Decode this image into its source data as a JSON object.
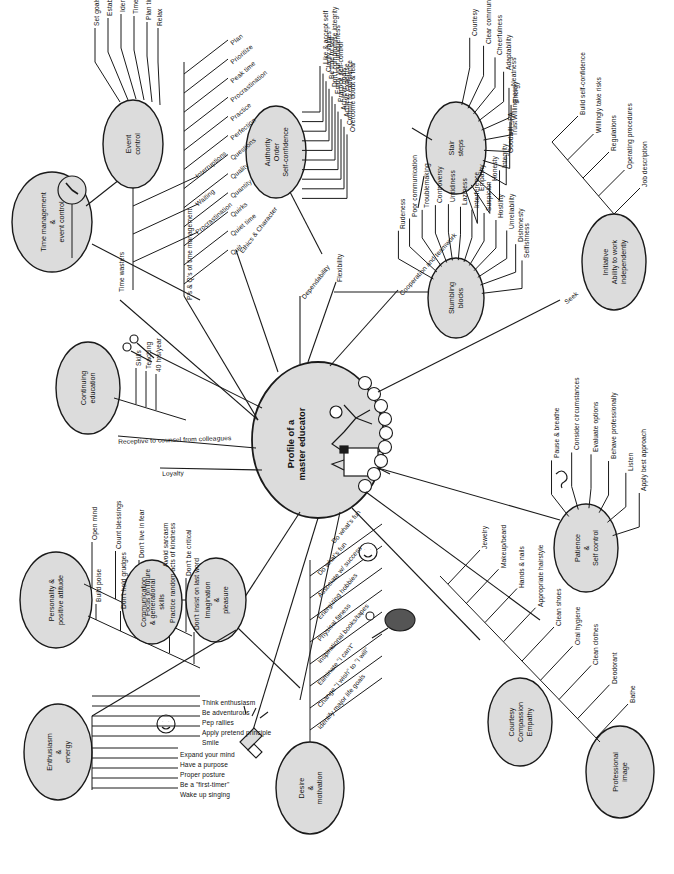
{
  "center": {
    "label_line1": "Profile of a",
    "label_line2": "master educator",
    "icon": "person-at-desk-icon"
  },
  "colors": {
    "node_fill": "#dcdcdc",
    "stroke": "#1a1a1a",
    "background": "#ffffff"
  },
  "spokes": [
    {
      "name": "ethics-character",
      "label": "Ethics & Character"
    },
    {
      "name": "dependability",
      "label": "Dependability"
    },
    {
      "name": "flexibility",
      "label": "Flexibility"
    },
    {
      "name": "cooperation-teamwork",
      "label": "Cooperation and teamwork"
    },
    {
      "name": "receptive-counsel",
      "label": "Receptive to counsel from colleagues"
    },
    {
      "name": "loyalty",
      "label": "Loyalty"
    },
    {
      "name": "seek",
      "label": "Seek"
    },
    {
      "name": "do-whats-fun",
      "label": "Do what's fun"
    }
  ],
  "branches": [
    {
      "name": "time-management",
      "label": "Time management\n&\nevent control",
      "label_lines": [
        "Time management",
        "&",
        "event control"
      ],
      "icon": "clock-icon",
      "children": []
    },
    {
      "name": "event-control",
      "label_lines": [
        "Event",
        "control"
      ],
      "children": [
        "Set goals",
        "Establish objectives",
        "Identify priorities",
        "Time log",
        "Plan time",
        "Relax"
      ]
    },
    {
      "name": "time-wasters",
      "label_lines": [
        "Time wasters"
      ],
      "children": [
        "Interruptions",
        "Waiting",
        "Procrastination"
      ]
    },
    {
      "name": "ps-and-qs",
      "label_lines": [
        "P's & Q's of time management"
      ],
      "children": [
        "Quit",
        "Quiet time",
        "Quirks",
        "Quantity",
        "Quality",
        "Questions",
        "Perfection",
        "Practice",
        "Procrastination",
        "Peak time",
        "Prioritize",
        "Plan"
      ]
    },
    {
      "name": "authority-order-self-confidence",
      "label_lines": [
        "Authority",
        "Order",
        "Self-confidence"
      ],
      "children": [
        "Like & accept self",
        "Clarify values",
        "Be true to self",
        "Don't compromise integrity",
        "Enjoy your uniqueness",
        "Practice self-control",
        "Achieve goals",
        "Achieve expertise",
        "Commit to excellence",
        "Overcome doubt & fear"
      ]
    },
    {
      "name": "stair-steps",
      "label_lines": [
        "Stair",
        "steps"
      ],
      "children": [
        "Courtesy",
        "Clear communications",
        "Cheerfulness",
        "Adaptability",
        "Neatness",
        "Energy",
        "Willingness",
        "Trust",
        "Goodwill - PA",
        "Integrity",
        "Honesty",
        "Empathy"
      ]
    },
    {
      "name": "stumbling-blocks",
      "label_lines": [
        "Stumbling",
        "blocks"
      ],
      "children": [
        "Rudeness",
        "Poor communication",
        "Troublemaking",
        "Controversy",
        "Untidiness",
        "Laziness",
        "Interference",
        "Suspicion",
        "Hostility",
        "Unreliability",
        "Dishonesty",
        "Selfishness"
      ]
    },
    {
      "name": "initiative",
      "label_lines": [
        "Initiative",
        "Ability to work",
        "independently"
      ],
      "children": [
        "Job description",
        "Operating procedures",
        "Regulations",
        "Willingly take risks",
        "Build self-confidence"
      ]
    },
    {
      "name": "continuing-education",
      "label_lines": [
        "Continuing",
        "education"
      ],
      "icon": "scissors-icon",
      "children": [
        "Skills",
        "Teaching",
        "40 hrs/year"
      ]
    },
    {
      "name": "personality-positive-attitude",
      "label_lines": [
        "Personality &",
        "positive attitude"
      ],
      "children": [
        "Open mind",
        "Count blessings",
        "Don't live in fear",
        "Avoid sarcasm",
        "Don't be critical",
        "Build poise",
        "Don't hold grudges",
        "Focus on future",
        "Practice random acts of kindness",
        "Don't insist on last word"
      ]
    },
    {
      "name": "communication-generational-skills",
      "label_lines": [
        "Communication",
        "& generational",
        "skills"
      ],
      "children": []
    },
    {
      "name": "imagination-pleasure",
      "label_lines": [
        "Imagination",
        "&",
        "pleasure"
      ],
      "children": []
    },
    {
      "name": "enthusiasm-energy",
      "label_lines": [
        "Enthusiasm",
        "&",
        "energy"
      ],
      "icons": [
        "smiley-icon",
        "megaphone-icon"
      ],
      "children": [
        "Wake up singing",
        "Be a \"first-timer\"",
        "Proper posture",
        "Have a purpose",
        "Expand your mind",
        "Smile",
        "Apply pretend principle",
        "Pep rallies",
        "Be adventurous",
        "Think enthusiasm"
      ]
    },
    {
      "name": "desire-motivation",
      "label_lines": [
        "Desire",
        "&",
        "motivation"
      ],
      "icons": [
        "smiley-icon",
        "tennis-racket-icon"
      ],
      "children": [
        "Do what's fun",
        "Associate w/ success",
        "Energizing hobbies",
        "Physical fitness",
        "Inspirational books/tapes",
        "Eliminate \"I can't\"",
        "Change \"I wish\" to \"I will\"",
        "Identify major life goals"
      ]
    },
    {
      "name": "courtesy-compassion-empathy",
      "label_lines": [
        "Courtesy",
        "Compassion",
        "Empathy"
      ],
      "children": []
    },
    {
      "name": "professional-image",
      "label_lines": [
        "Professional",
        "image"
      ],
      "children": [
        "Bathe",
        "Deodorant",
        "Clean clothes",
        "Oral hygiene",
        "Clean shoes",
        "Appropriate hairstyle",
        "Hands & nails",
        "Makeup/beard",
        "Jewelry"
      ]
    },
    {
      "name": "patience-self-control",
      "label_lines": [
        "Patience",
        "&",
        "Self control"
      ],
      "icon": "ear-icon",
      "children": [
        "Pause & breathe",
        "Consider circumstances",
        "Evaluate options",
        "Behave professionally",
        "Listen",
        "Apply best approach"
      ]
    }
  ]
}
